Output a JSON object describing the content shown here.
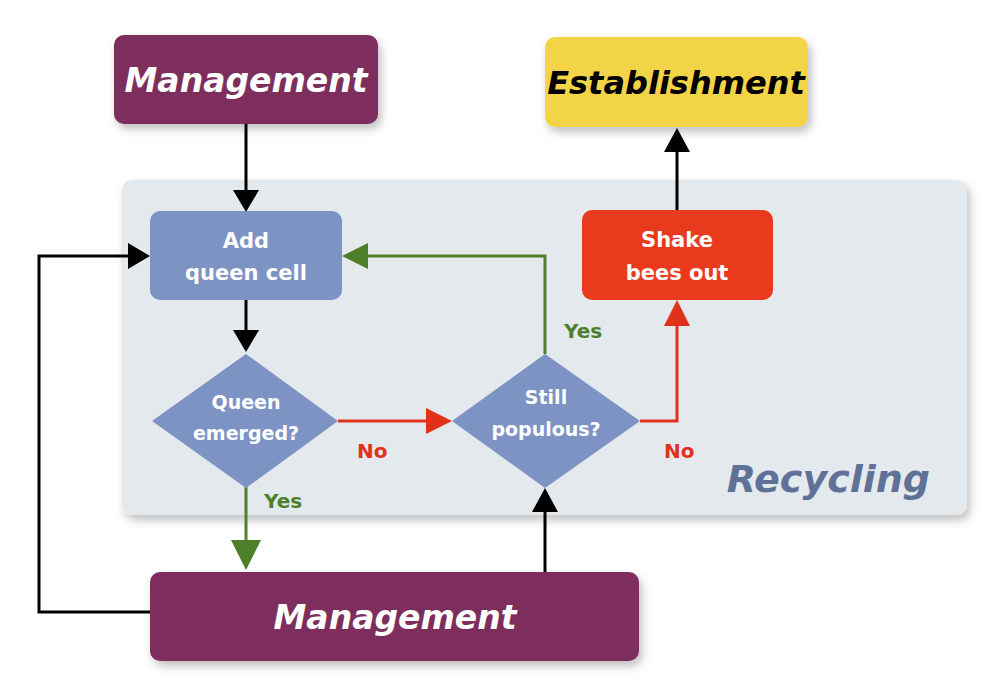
{
  "diagram": {
    "colors": {
      "management": "#7e2e5b",
      "establishment": "#f4d447",
      "process_box": "#7d93c4",
      "shake_box": "#ea3a1e",
      "recycling_panel": "#e4e9ee",
      "recycling_label": "#5f7196",
      "yes": "#4e7f2a",
      "no": "#e0321b",
      "neutral_arrow": "#000000"
    },
    "nodes": {
      "management_top": {
        "label": "Management"
      },
      "establishment": {
        "label": "Establishment"
      },
      "add_queen_cell": {
        "line1": "Add",
        "line2": "queen cell"
      },
      "shake_bees_out": {
        "line1": "Shake",
        "line2": "bees out"
      },
      "queen_emerged": {
        "line1": "Queen",
        "line2": "emerged?"
      },
      "still_populous": {
        "line1": "Still",
        "line2": "populous?"
      },
      "management_bottom": {
        "label": "Management"
      }
    },
    "regions": {
      "recycling": {
        "label": "Recycling"
      }
    },
    "edge_labels": {
      "queen_emerged_no": "No",
      "queen_emerged_yes": "Yes",
      "still_populous_yes": "Yes",
      "still_populous_no": "No"
    }
  }
}
